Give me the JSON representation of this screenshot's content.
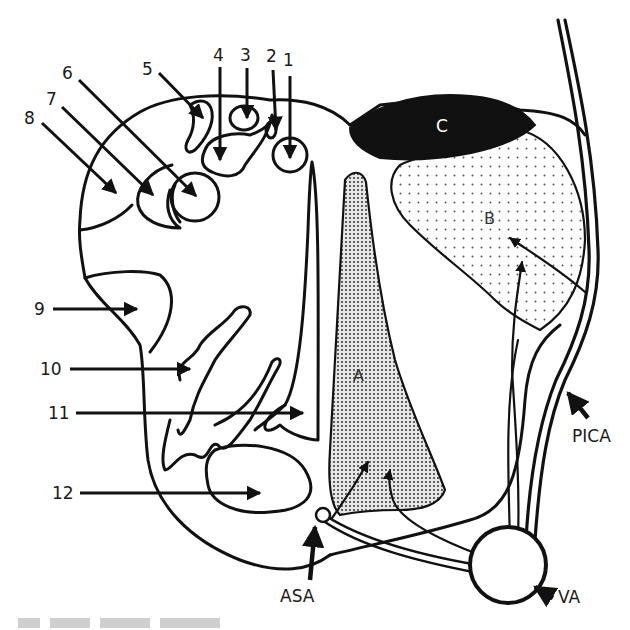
{
  "figure": {
    "type": "anatomical cross-section diagram",
    "numbered_labels": [
      "1",
      "2",
      "3",
      "4",
      "5",
      "6",
      "7",
      "8",
      "9",
      "10",
      "11",
      "12"
    ],
    "region_labels": {
      "A": "A",
      "B": "B",
      "C": "C"
    },
    "vessel_labels": {
      "pica": "PICA",
      "asa": "ASA",
      "va": "VA"
    },
    "colors": {
      "line": "#111111",
      "region_c_fill": "#111111",
      "stipple": "#555555",
      "background": "#ffffff"
    },
    "caption_visible": "cut off / illegible"
  }
}
